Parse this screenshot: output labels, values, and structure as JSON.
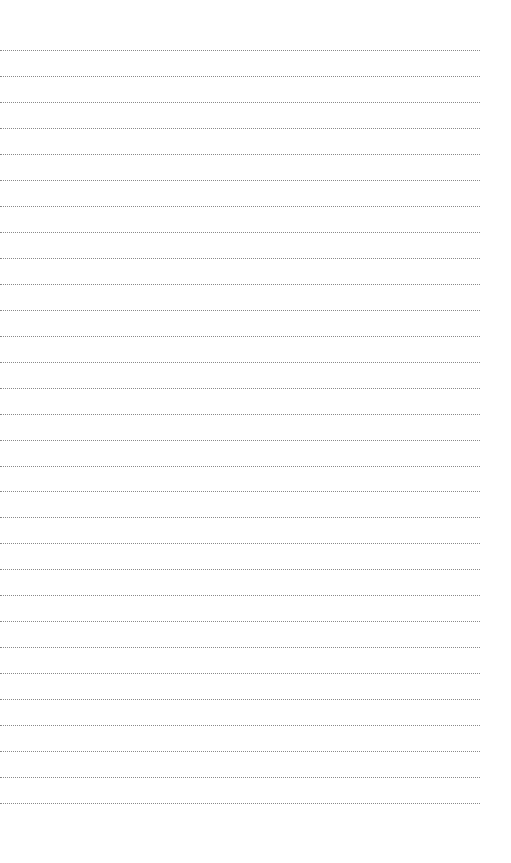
{
  "page": {
    "type": "blank dotted-line writing sheet",
    "background_color": "#ffffff",
    "rule_color": "#8a8a8a",
    "rule_style": "dotted",
    "rule_count": 30,
    "first_rule_y": 50,
    "rule_spacing": 25.97,
    "rule_left": 0,
    "rule_width": 480
  }
}
